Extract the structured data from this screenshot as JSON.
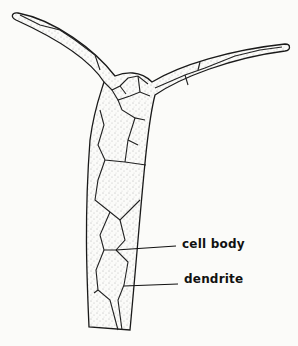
{
  "figure": {
    "labels": [
      {
        "id": "cell-body",
        "text": "cell body"
      },
      {
        "id": "dendrite",
        "text": "dendrite"
      }
    ],
    "colors": {
      "background": "#fbfbf9",
      "outline": "#1a1a1a",
      "stipple": "#555555",
      "label": "#111111"
    }
  }
}
